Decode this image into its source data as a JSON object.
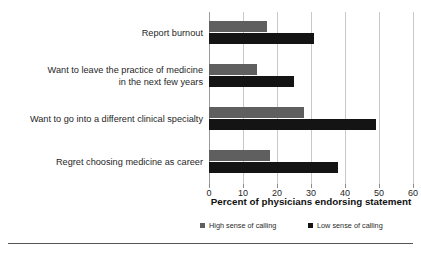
{
  "chart_data": {
    "type": "bar",
    "orientation": "horizontal",
    "title": "",
    "xlabel": "Percent of physicians endorsing statement",
    "ylabel": "",
    "xlim": [
      0,
      60
    ],
    "xticks": [
      0,
      10,
      20,
      30,
      40,
      50,
      60
    ],
    "grid": true,
    "legend_position": "bottom",
    "categories": [
      "Report burnout",
      "Want to leave the practice of medicine\nin the next few years",
      "Want to go into a different clinical specialty",
      "Regret choosing medicine as career"
    ],
    "series": [
      {
        "name": "High sense of calling",
        "color": "#5f5f5f",
        "values": [
          17,
          14,
          28,
          18
        ]
      },
      {
        "name": "Low sense of calling",
        "color": "#141414",
        "values": [
          31,
          25,
          49,
          38
        ]
      }
    ]
  },
  "axis": {
    "tick_labels": [
      "0",
      "10",
      "20",
      "30",
      "40",
      "50",
      "60"
    ],
    "title": "Percent of physicians endorsing statement"
  },
  "categories": {
    "c0": "Report burnout",
    "c1": "Want to leave the practice of medicine\nin the next few years",
    "c2": "Want to go into a different clinical specialty",
    "c3": "Regret choosing medicine as career"
  },
  "legend": {
    "high_label": "High sense of calling",
    "low_label": "Low sense of calling",
    "high_color": "#5f5f5f",
    "low_color": "#141414"
  }
}
